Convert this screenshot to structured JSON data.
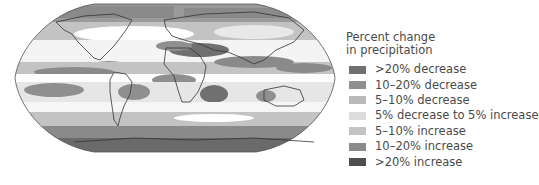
{
  "map": {
    "projection": "Robinson",
    "subject": "World map of projected percent change in precipitation",
    "ocean_land_fill_base": "#ffffff",
    "coastline_color": "#333333"
  },
  "legend": {
    "title_line1": "Percent change",
    "title_line2": "in precipitation",
    "items": [
      {
        "label": ">20% decrease",
        "color": "#707070"
      },
      {
        "label": "10–20% decrease",
        "color": "#8f8f8f"
      },
      {
        "label": "5–10% decrease",
        "color": "#b9b9b9"
      },
      {
        "label": "5% decrease to 5% increase",
        "color": "#dcdcdc"
      },
      {
        "label": "5–10% increase",
        "color": "#c3c3c3"
      },
      {
        "label": "10–20% increase",
        "color": "#8a8a8a"
      },
      {
        "label": ">20% increase",
        "color": "#4f4f4f"
      }
    ]
  }
}
